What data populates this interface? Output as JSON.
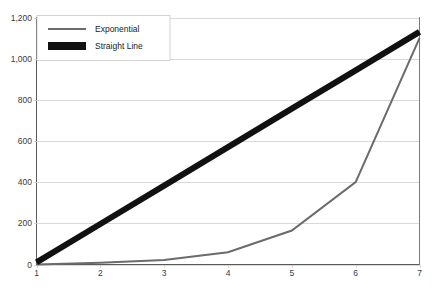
{
  "chart_data": {
    "type": "line",
    "title": "",
    "subtitle": "",
    "xlabel": "",
    "ylabel": "",
    "x": [
      1,
      2,
      3,
      4,
      5,
      6,
      7
    ],
    "xlim": [
      1,
      7
    ],
    "ylim": [
      0,
      1200
    ],
    "grid": true,
    "legend_position": "top-left",
    "x_ticks": [
      "1",
      "2",
      "3",
      "4",
      "5",
      "6",
      "7"
    ],
    "y_ticks": [
      "0",
      "200",
      "400",
      "600",
      "800",
      "1,000",
      "1,200"
    ],
    "y_tick_values": [
      0,
      200,
      400,
      600,
      800,
      1000,
      1200
    ],
    "series": [
      {
        "name": "Exponential",
        "values": [
          0,
          8,
          22,
          60,
          165,
          400,
          1100
        ],
        "color": "#6b6b6b",
        "width": 2,
        "swatch": "line"
      },
      {
        "name": "Straight Line",
        "values": [
          10,
          197,
          383,
          570,
          757,
          943,
          1130
        ],
        "color": "#111111",
        "width": 6,
        "swatch": "bar"
      }
    ]
  },
  "legend": {
    "items": [
      {
        "label": "Exponential"
      },
      {
        "label": "Straight Line"
      }
    ]
  },
  "colors": {
    "grid": "#cfcfcf",
    "axis": "#5a5a5a",
    "background": "#ffffff",
    "tick_text": "#3a3a3a",
    "legend_border": "#c8c8c8"
  }
}
